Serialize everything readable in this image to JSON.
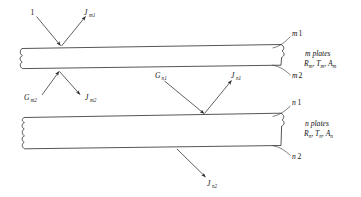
{
  "figure": {
    "background_color": "#ffffff",
    "line_color": "#2b2b2b",
    "text_color": "#111111"
  },
  "plates": {
    "upper": {
      "name": "m plates",
      "caption_line1": "m plates",
      "caption_symbol": "R",
      "caption_sub1": "m",
      "caption_symbol2": "T",
      "caption_sub2": "m",
      "caption_symbol3": "A",
      "caption_sub3": "m",
      "surface_top_label_base": "m",
      "surface_top_label_index": "1",
      "surface_bottom_label_base": "m",
      "surface_bottom_label_index": "2"
    },
    "lower": {
      "name": "n plates",
      "caption_line1": "n plates",
      "caption_symbol": "R",
      "caption_sub1": "n",
      "caption_symbol2": "T",
      "caption_sub2": "n",
      "caption_symbol3": "A",
      "caption_sub3": "n",
      "surface_top_label_base": "n",
      "surface_top_label_index": "1",
      "surface_bottom_label_base": "n",
      "surface_bottom_label_index": "2"
    }
  },
  "arrows": {
    "incident_top": {
      "label": "1",
      "symbol": "1",
      "subscript": ""
    },
    "radiosity_m1": {
      "symbol": "J",
      "subscript": "m1"
    },
    "irradiation_m2": {
      "symbol": "G",
      "subscript": "m2"
    },
    "radiosity_m2": {
      "symbol": "J",
      "subscript": "m2"
    },
    "irradiation_n1": {
      "symbol": "G",
      "subscript": "n1"
    },
    "radiosity_n1": {
      "symbol": "J",
      "subscript": "n1"
    },
    "radiosity_n2": {
      "symbol": "J",
      "subscript": "n2"
    }
  }
}
